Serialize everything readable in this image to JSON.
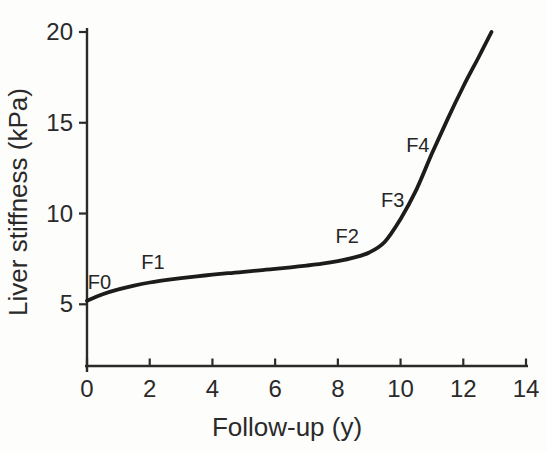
{
  "figure": {
    "background_color": "#fdfdfc",
    "ink_color": "#2a2a2a"
  },
  "chart_data": {
    "type": "line",
    "title": "",
    "xlabel": "Follow-up (y)",
    "ylabel": "Liver stiffness (kPa)",
    "xlim": [
      0,
      14
    ],
    "ylim": [
      1.6,
      20
    ],
    "x_ticks": [
      0,
      2,
      4,
      6,
      8,
      10,
      12,
      14
    ],
    "y_ticks": [
      5,
      10,
      15,
      20
    ],
    "grid": false,
    "legend": "none",
    "series": [
      {
        "name": "liver-stiffness-progression",
        "color": "#1c1c1c",
        "points": [
          [
            0,
            5.2
          ],
          [
            0.5,
            5.55
          ],
          [
            1,
            5.82
          ],
          [
            1.5,
            6.03
          ],
          [
            2,
            6.2
          ],
          [
            2.5,
            6.33
          ],
          [
            3,
            6.44
          ],
          [
            3.5,
            6.54
          ],
          [
            4,
            6.63
          ],
          [
            4.5,
            6.71
          ],
          [
            5,
            6.79
          ],
          [
            5.5,
            6.87
          ],
          [
            6,
            6.95
          ],
          [
            6.5,
            7.04
          ],
          [
            7,
            7.13
          ],
          [
            7.5,
            7.24
          ],
          [
            8,
            7.38
          ],
          [
            8.5,
            7.57
          ],
          [
            9,
            7.85
          ],
          [
            9.5,
            8.45
          ],
          [
            10,
            9.7
          ],
          [
            10.5,
            11.3
          ],
          [
            11,
            13.3
          ],
          [
            11.5,
            15.2
          ],
          [
            12,
            17.0
          ],
          [
            12.5,
            18.65
          ],
          [
            12.9,
            20
          ]
        ]
      }
    ],
    "annotations": [
      {
        "label": "F0",
        "x": 0.4,
        "y": 6.25
      },
      {
        "label": "F1",
        "x": 2.1,
        "y": 7.35
      },
      {
        "label": "F2",
        "x": 8.3,
        "y": 8.75
      },
      {
        "label": "F3",
        "x": 9.75,
        "y": 10.75
      },
      {
        "label": "F4",
        "x": 10.55,
        "y": 13.8
      }
    ]
  }
}
